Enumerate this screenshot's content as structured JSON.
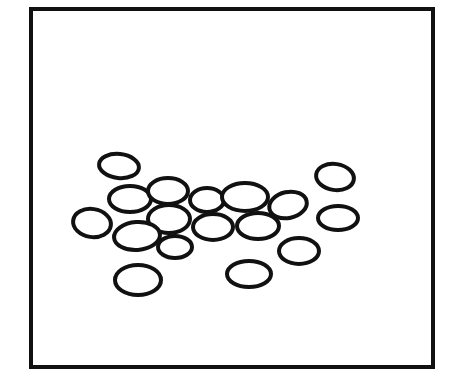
{
  "figure": {
    "background": "#ffffff",
    "stroke_color": "#111111",
    "frame": {
      "x": 31,
      "y": 9,
      "width": 402,
      "height": 358,
      "stroke_width": 4
    },
    "ellipse_stroke_width": 4,
    "ellipses": [
      {
        "id": "e1",
        "cx": 119,
        "cy": 166,
        "rx": 20,
        "ry": 12,
        "rot": 6
      },
      {
        "id": "e2",
        "cx": 335,
        "cy": 177,
        "rx": 19,
        "ry": 13,
        "rot": 8
      },
      {
        "id": "e3",
        "cx": 338,
        "cy": 218,
        "rx": 20,
        "ry": 12,
        "rot": 0
      },
      {
        "id": "e4",
        "cx": 138,
        "cy": 280,
        "rx": 23,
        "ry": 15,
        "rot": 0
      },
      {
        "id": "e5",
        "cx": 249,
        "cy": 274,
        "rx": 22,
        "ry": 13,
        "rot": 0
      },
      {
        "id": "e6",
        "cx": 299,
        "cy": 251,
        "rx": 20,
        "ry": 13,
        "rot": 0
      },
      {
        "id": "e7",
        "cx": 92,
        "cy": 223,
        "rx": 19,
        "ry": 14,
        "rot": 8
      },
      {
        "id": "e8",
        "cx": 130,
        "cy": 199,
        "rx": 21,
        "ry": 13,
        "rot": 0
      },
      {
        "id": "e9",
        "cx": 168,
        "cy": 191,
        "rx": 20,
        "ry": 13,
        "rot": 0
      },
      {
        "id": "e10",
        "cx": 169,
        "cy": 219,
        "rx": 21,
        "ry": 14,
        "rot": 0
      },
      {
        "id": "e11",
        "cx": 137,
        "cy": 236,
        "rx": 23,
        "ry": 14,
        "rot": -4
      },
      {
        "id": "e12",
        "cx": 175,
        "cy": 247,
        "rx": 17,
        "ry": 11,
        "rot": 0
      },
      {
        "id": "e13",
        "cx": 207,
        "cy": 200,
        "rx": 17,
        "ry": 12,
        "rot": 0
      },
      {
        "id": "e14",
        "cx": 245,
        "cy": 197,
        "rx": 23,
        "ry": 14,
        "rot": 0
      },
      {
        "id": "e15",
        "cx": 213,
        "cy": 227,
        "rx": 20,
        "ry": 13,
        "rot": 0
      },
      {
        "id": "e16",
        "cx": 258,
        "cy": 226,
        "rx": 21,
        "ry": 13,
        "rot": 0
      },
      {
        "id": "e17",
        "cx": 288,
        "cy": 205,
        "rx": 19,
        "ry": 13,
        "rot": -12
      }
    ]
  }
}
